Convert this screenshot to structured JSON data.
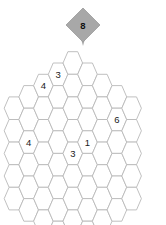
{
  "puzzle": {
    "title": "Hexagonal Cell Grid Puzzle",
    "grid_shape": "hexagon-of-hexagons",
    "colors": {
      "cell_fill": "#ffffff",
      "cell_stroke": "#b9b9b9",
      "marker_fill": "#a8a8a8",
      "text": "#1a1a1a",
      "background": "#ffffff"
    },
    "geometry": {
      "hex_width": 19.6,
      "hex_height": 22.6,
      "col_step": 14.7,
      "row_step": 22.6,
      "origin_x": 14.0,
      "origin_y": 63.0,
      "column_lengths": [
        5,
        6,
        7,
        8,
        9,
        8,
        7,
        6,
        5
      ]
    },
    "marker": {
      "name": "top-marker",
      "label": "8",
      "cx": 83,
      "cy": 25,
      "radius": 17,
      "stem_x": 83,
      "stem_y": 42
    },
    "clues": [
      {
        "label": "4",
        "col": 2,
        "row": 0,
        "cx": 50.3,
        "cy": 74.3
      },
      {
        "label": "3",
        "col": 3,
        "row": 0,
        "cx": 65.0,
        "cy": 97.0
      },
      {
        "label": "6",
        "col": 7,
        "row": 1,
        "cx": 132.7,
        "cy": 97.0
      },
      {
        "label": "4",
        "col": 1,
        "row": 2,
        "cx": 35.6,
        "cy": 142.6
      },
      {
        "label": "1",
        "col": 5,
        "row": 3,
        "cx": 94.9,
        "cy": 142.6
      },
      {
        "label": "3",
        "col": 4,
        "row": 4,
        "cx": 83.0,
        "cy": 165.3
      }
    ]
  }
}
